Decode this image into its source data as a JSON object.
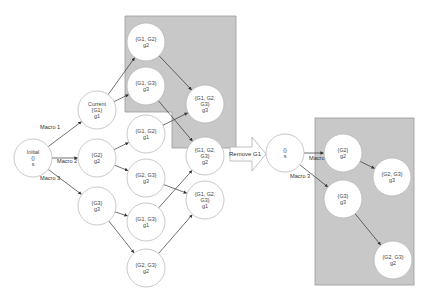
{
  "colors": {
    "region_fill": "#c8c8c8",
    "region_stroke": "#9a9a9a",
    "node_fill": "#ffffff",
    "node_stroke": "#b0b0b0",
    "edge": "#333333"
  },
  "left_graph": {
    "nodes": [
      {
        "id": "initial",
        "cx": 33,
        "cy": 158,
        "lines": [
          "Initial",
          "{}",
          "s"
        ]
      },
      {
        "id": "current_g1",
        "cx": 97,
        "cy": 110,
        "lines": [
          "Current",
          "{G1}",
          "g1"
        ]
      },
      {
        "id": "g2",
        "cx": 97,
        "cy": 158,
        "lines": [
          "{G2}",
          "g2"
        ]
      },
      {
        "id": "g3",
        "cx": 97,
        "cy": 206,
        "lines": [
          "{G3}",
          "g3"
        ]
      },
      {
        "id": "g1g2_g2",
        "cx": 146,
        "cy": 42,
        "lines": [
          "{G1, G2}",
          "g2"
        ]
      },
      {
        "id": "g1g3_g3",
        "cx": 146,
        "cy": 86,
        "lines": [
          "{G1, G3}",
          "g3"
        ]
      },
      {
        "id": "g1g2_g1",
        "cx": 146,
        "cy": 134,
        "lines": [
          "{G1, G2}",
          "g1"
        ]
      },
      {
        "id": "g2g3_g3",
        "cx": 146,
        "cy": 178,
        "lines": [
          "{G2, G3}",
          "g3"
        ]
      },
      {
        "id": "g1g3_g1",
        "cx": 146,
        "cy": 222,
        "lines": [
          "{G1, G3}",
          "g1"
        ]
      },
      {
        "id": "g2g3_g2",
        "cx": 146,
        "cy": 268,
        "lines": [
          "{G2, G3}",
          "g2"
        ]
      },
      {
        "id": "all_g3",
        "cx": 205,
        "cy": 104,
        "lines": [
          "{G1, G2,",
          "G3}",
          "g3"
        ]
      },
      {
        "id": "all_g2",
        "cx": 205,
        "cy": 156,
        "lines": [
          "{G1, G2,",
          "G3}",
          "g2"
        ]
      },
      {
        "id": "all_g1",
        "cx": 205,
        "cy": 200,
        "lines": [
          "{G1, G2,",
          "G3}",
          "g1"
        ]
      }
    ],
    "edges": [
      {
        "from": "initial",
        "to": "current_g1",
        "label": "Macro 1"
      },
      {
        "from": "initial",
        "to": "g2",
        "label": "Macro 2"
      },
      {
        "from": "initial",
        "to": "g3",
        "label": "Macro 3"
      },
      {
        "from": "current_g1",
        "to": "g1g2_g2"
      },
      {
        "from": "current_g1",
        "to": "g1g3_g3"
      },
      {
        "from": "g2",
        "to": "g1g2_g1"
      },
      {
        "from": "g2",
        "to": "g2g3_g3"
      },
      {
        "from": "g3",
        "to": "g1g3_g1"
      },
      {
        "from": "g3",
        "to": "g2g3_g2"
      },
      {
        "from": "g1g2_g2",
        "to": "all_g3"
      },
      {
        "from": "g1g3_g3",
        "to": "all_g2"
      },
      {
        "from": "g1g2_g1",
        "to": "all_g3"
      },
      {
        "from": "g2g3_g3",
        "to": "all_g1"
      },
      {
        "from": "g1g3_g1",
        "to": "all_g2"
      },
      {
        "from": "g2g3_g2",
        "to": "all_g1"
      }
    ]
  },
  "transition": {
    "label": "Remove G1"
  },
  "right_graph": {
    "nodes": [
      {
        "id": "r_s",
        "cx": 285,
        "cy": 153,
        "lines": [
          "{}",
          "s"
        ]
      },
      {
        "id": "r_g2",
        "cx": 343,
        "cy": 153,
        "lines": [
          "{G2}",
          "g2"
        ]
      },
      {
        "id": "r_g2g3_g3",
        "cx": 392,
        "cy": 177,
        "lines": [
          "{G2, G3}",
          "g3"
        ]
      },
      {
        "id": "r_g3",
        "cx": 343,
        "cy": 199,
        "lines": [
          "{G3}",
          "g3"
        ]
      },
      {
        "id": "r_g2g3_g2",
        "cx": 393,
        "cy": 260,
        "lines": [
          "{G2, G3}",
          "g2"
        ]
      }
    ],
    "edges": [
      {
        "from": "r_s",
        "to": "r_g2",
        "label": "Macro 2"
      },
      {
        "from": "r_s",
        "to": "r_g3",
        "label": "Macro 3"
      },
      {
        "from": "r_g2",
        "to": "r_g2g3_g3"
      },
      {
        "from": "r_g3",
        "to": "r_g2g3_g2"
      }
    ]
  }
}
